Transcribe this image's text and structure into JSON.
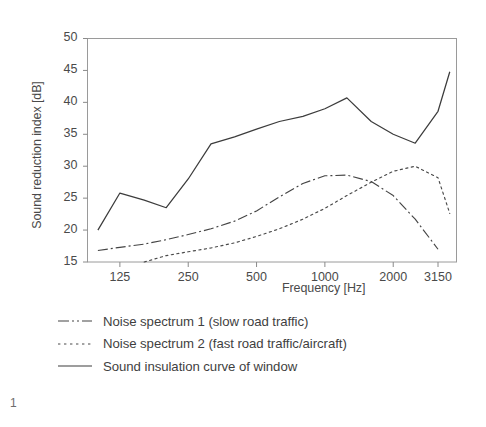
{
  "figure": {
    "number": "1"
  },
  "chart_data": {
    "type": "line",
    "title": "",
    "xlabel": "Frequency [Hz]",
    "ylabel": "Sound reduction index [dB]",
    "xscale": "log",
    "xtick_labels": [
      "125",
      "250",
      "500",
      "1000",
      "2000",
      "3150"
    ],
    "xtick_values": [
      125,
      250,
      500,
      1000,
      2000,
      3150
    ],
    "ytick_labels": [
      "15",
      "20",
      "25",
      "30",
      "35",
      "40",
      "45",
      "50"
    ],
    "ytick_values": [
      15,
      20,
      25,
      30,
      35,
      40,
      45,
      50
    ],
    "ylim": [
      15,
      50
    ],
    "xlim": [
      90,
      3800
    ],
    "grid": false,
    "legend_position": "below-plot",
    "series": [
      {
        "name": "Noise spectrum 1 (slow road traffic)",
        "style": "dash-dot",
        "color": "#444444",
        "x": [
          100,
          125,
          160,
          200,
          250,
          315,
          400,
          500,
          630,
          800,
          1000,
          1250,
          1600,
          2000,
          2500,
          3150
        ],
        "y": [
          16.8,
          17.3,
          17.8,
          18.5,
          19.3,
          20.2,
          21.4,
          23.0,
          25.2,
          27.3,
          28.5,
          28.6,
          27.6,
          25.4,
          21.7,
          17.0
        ]
      },
      {
        "name": "Noise spectrum 2 (fast road traffic/aircraft)",
        "style": "dotted",
        "color": "#4a4a4a",
        "x": [
          160,
          200,
          250,
          315,
          400,
          500,
          630,
          800,
          1000,
          1250,
          1600,
          2000,
          2500,
          3150,
          3550
        ],
        "y": [
          15.0,
          16.0,
          16.6,
          17.2,
          18.0,
          19.0,
          20.2,
          21.7,
          23.4,
          25.4,
          27.5,
          29.2,
          30.0,
          28.2,
          22.6
        ]
      },
      {
        "name": "Sound insulation curve of window",
        "style": "solid",
        "color": "#3c3c3c",
        "x": [
          100,
          125,
          160,
          200,
          250,
          315,
          400,
          500,
          630,
          800,
          1000,
          1250,
          1600,
          2000,
          2500,
          3150,
          3550
        ],
        "y": [
          20.0,
          25.8,
          24.7,
          23.5,
          28.0,
          33.5,
          34.6,
          35.8,
          37.0,
          37.8,
          39.0,
          40.7,
          37.0,
          35.0,
          33.6,
          38.6,
          44.8
        ]
      }
    ]
  },
  "legend": [
    {
      "label": "Noise spectrum 1 (slow road traffic)",
      "style": "dash-dot"
    },
    {
      "label": "Noise spectrum 2 (fast road traffic/aircraft)",
      "style": "dotted"
    },
    {
      "label": "Sound insulation curve of window",
      "style": "solid"
    }
  ]
}
